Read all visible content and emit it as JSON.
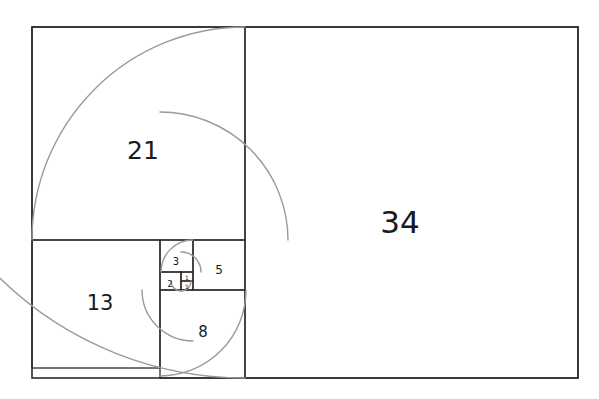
{
  "figure": {
    "background_color": "#ffffff",
    "line_color": "#2b2b2b",
    "spiral_color": "#9a9a9a",
    "label_color": "#1a1a1a",
    "outer_rect": {
      "x": 32,
      "y": 27,
      "width": 546,
      "height": 351
    }
  },
  "chart_data": {
    "type": "diagram",
    "sequence": [
      1,
      1,
      2,
      3,
      5,
      8,
      13,
      21,
      34
    ],
    "labels_visible": [
      "1",
      "1",
      "2",
      "3",
      "5",
      "8",
      "13",
      "21",
      "34"
    ],
    "squares": [
      {
        "label": "34",
        "side_units": 34,
        "x": 245,
        "y": 27,
        "w": 333,
        "h": 351,
        "label_x": 400,
        "label_y": 222,
        "font_size": 31,
        "arc": {
          "cx": 245,
          "cy": 27,
          "r": 351,
          "start_deg": 90,
          "sweep_deg": 90
        }
      },
      {
        "label": "21",
        "side_units": 21,
        "x": 32,
        "y": 27,
        "w": 213,
        "h": 213,
        "label_x": 143,
        "label_y": 150,
        "font_size": 25,
        "arc": {
          "cx": 245,
          "cy": 240,
          "r": 213,
          "start_deg": 180,
          "sweep_deg": 90
        }
      },
      {
        "label": "13",
        "side_units": 13,
        "x": 32,
        "y": 240,
        "w": 128,
        "h": 128,
        "label_x": 100,
        "label_y": 303,
        "font_size": 21,
        "arc": {
          "cx": 160,
          "cy": 240,
          "r": 128,
          "start_deg": 270,
          "sweep_deg": 90
        }
      },
      {
        "label": "8",
        "side_units": 8,
        "x": 160,
        "y": 290,
        "w": 85,
        "h": 88,
        "label_x": 203,
        "label_y": 332,
        "font_size": 15,
        "arc": {
          "cx": 160,
          "cy": 290,
          "r": 86,
          "start_deg": 0,
          "sweep_deg": 90
        }
      },
      {
        "label": "5",
        "side_units": 5,
        "x": 193,
        "y": 240,
        "w": 52,
        "h": 50,
        "label_x": 219,
        "label_y": 270,
        "font_size": 12,
        "arc": {
          "cx": 193,
          "cy": 290,
          "r": 51,
          "start_deg": 90,
          "sweep_deg": 90
        }
      },
      {
        "label": "3",
        "side_units": 3,
        "x": 160,
        "y": 240,
        "w": 33,
        "h": 32,
        "label_x": 176,
        "label_y": 261,
        "font_size": 10,
        "arc": {
          "cx": 193,
          "cy": 272,
          "r": 32,
          "start_deg": 180,
          "sweep_deg": 90
        }
      },
      {
        "label": "2",
        "side_units": 2,
        "x": 160,
        "y": 272,
        "w": 21,
        "h": 18,
        "label_x": 170,
        "label_y": 284,
        "font_size": 8,
        "arc": {
          "cx": 181,
          "cy": 272,
          "r": 20,
          "start_deg": 270,
          "sweep_deg": 90
        }
      },
      {
        "label": "1",
        "side_units": 1,
        "x": 181,
        "y": 281,
        "w": 12,
        "h": 9,
        "label_x": 187,
        "label_y": 286,
        "font_size": 6,
        "arc": {
          "cx": 181,
          "cy": 281,
          "r": 10,
          "start_deg": 0,
          "sweep_deg": 90
        }
      },
      {
        "label": "1",
        "side_units": 1,
        "x": 181,
        "y": 272,
        "w": 12,
        "h": 9,
        "label_x": 187,
        "label_y": 277,
        "font_size": 6,
        "arc": {
          "cx": 181,
          "cy": 281,
          "r": 10,
          "start_deg": 90,
          "sweep_deg": 90
        }
      }
    ],
    "spiral_path_description": "Quarter-circle arcs chained through squares 1,1,2,3,5,8,13,21,34 forming a golden/Fibonacci spiral",
    "grid": false,
    "legend": null,
    "xlabel": "",
    "ylabel": ""
  }
}
